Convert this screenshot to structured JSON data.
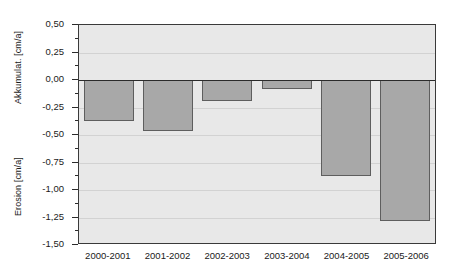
{
  "chart_data": {
    "type": "bar",
    "title": "",
    "subtitle": "",
    "xlabel": "",
    "ylabel": "Erosion [cm/a] / Akkumulat. [cm/a]",
    "categories": [
      "2000-2001",
      "2001-2002",
      "2002-2003",
      "2003-2004",
      "2004-2005",
      "2005-2006"
    ],
    "values": [
      -0.37,
      -0.46,
      -0.19,
      -0.08,
      -0.87,
      -1.28
    ],
    "series": [
      {
        "name": "Erosion/Akkumulation",
        "values": [
          -0.37,
          -0.46,
          -0.19,
          -0.08,
          -0.87,
          -1.28
        ]
      }
    ],
    "ylim": [
      -1.5,
      0.5
    ],
    "ytick_values": [
      0.5,
      0.25,
      0.0,
      -0.25,
      -0.5,
      -0.75,
      -1.0,
      -1.25,
      -1.5
    ],
    "ytick_labels": [
      "0,50",
      "0,25",
      "0,00",
      "-0,25",
      "-0,50",
      "-0,75",
      "-1,00",
      "-1,25",
      "-1,50"
    ],
    "ytick_minor_values": [
      0.375,
      0.125,
      -0.125,
      -0.375,
      -0.625,
      -0.875,
      -1.125,
      -1.375
    ],
    "grid": true,
    "grid_axis": "y",
    "legend": false,
    "legend_position": "none",
    "zero_line": true,
    "decimal_separator": ",",
    "axis_titles": {
      "upper": "Akkumulat. [cm/a]",
      "lower": "Erosion [cm/a]"
    },
    "colors": {
      "bar_fill": "#a8a8a8",
      "bar_border": "#5e5e5e",
      "plot_background": "#e8e8e8",
      "page_background": "#ffffff",
      "axis_line": "#3a3a3a",
      "zero_line": "#2b2b2b",
      "gridline": "#d2d2d2",
      "text": "#1a1a1a"
    }
  }
}
